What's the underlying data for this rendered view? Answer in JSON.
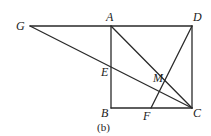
{
  "figure": {
    "caption": "(b)",
    "points": {
      "G": {
        "label": "G",
        "x": 30,
        "y": 26
      },
      "A": {
        "label": "A",
        "x": 111,
        "y": 26
      },
      "D": {
        "label": "D",
        "x": 192,
        "y": 26
      },
      "B": {
        "label": "B",
        "x": 111,
        "y": 108
      },
      "C": {
        "label": "C",
        "x": 192,
        "y": 108
      },
      "E": {
        "label": "E",
        "x": 111,
        "y": 68
      },
      "M": {
        "label": "M",
        "x": 160,
        "y": 91
      },
      "F": {
        "label": "F",
        "x": 151,
        "y": 108
      }
    },
    "segments": [
      "GD",
      "AB",
      "BC",
      "CD",
      "AC",
      "GC",
      "DF"
    ],
    "colors": {
      "line": "#2a2a2a",
      "text": "#222222",
      "background": "#ffffff"
    }
  }
}
